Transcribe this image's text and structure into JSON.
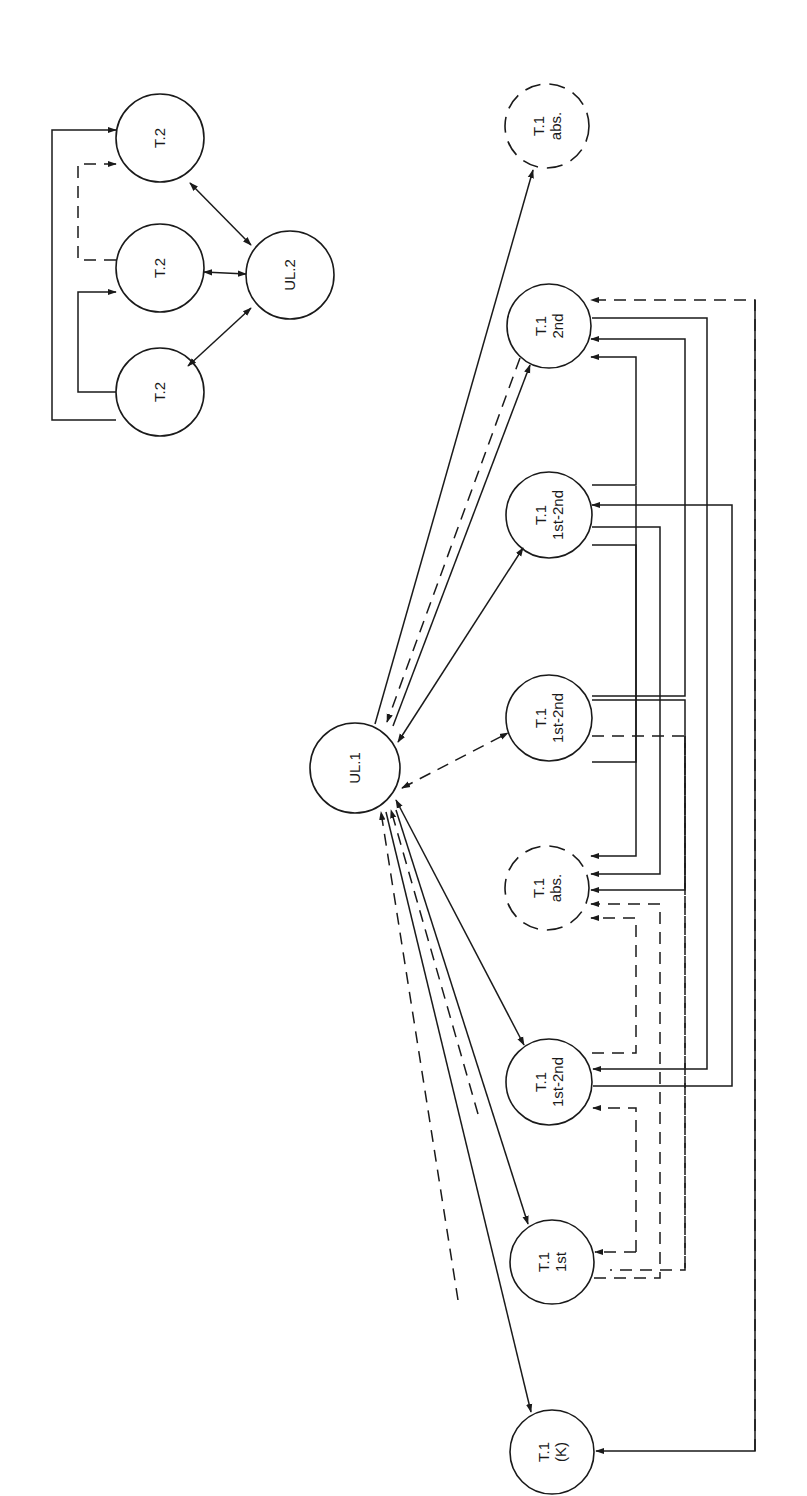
{
  "diagram": {
    "title": "",
    "orientation": "rotated-90-ccw",
    "colors": {
      "ink": "#1a1a1a",
      "paper": "#ffffff"
    },
    "clusters": [
      {
        "id": "group2",
        "label": "UL.2 group"
      },
      {
        "id": "group1",
        "label": "UL.1 group"
      }
    ],
    "nodes": [
      {
        "id": "t2a",
        "cluster": "group2",
        "lines": [
          "T.2"
        ],
        "cx": 160,
        "cy": 138,
        "r": 44,
        "style": "solid"
      },
      {
        "id": "t2b",
        "cluster": "group2",
        "lines": [
          "T.2"
        ],
        "cx": 160,
        "cy": 268,
        "r": 44,
        "style": "solid"
      },
      {
        "id": "t2c",
        "cluster": "group2",
        "lines": [
          "T.2"
        ],
        "cx": 160,
        "cy": 392,
        "r": 44,
        "style": "solid"
      },
      {
        "id": "ul2",
        "cluster": "group2",
        "lines": [
          "UL.2"
        ],
        "cx": 290,
        "cy": 275,
        "r": 44,
        "style": "solid"
      },
      {
        "id": "ul1",
        "cluster": "group1",
        "lines": [
          "UL.1"
        ],
        "cx": 355,
        "cy": 768,
        "r": 45,
        "style": "solid"
      },
      {
        "id": "t1abs_top",
        "cluster": "group1",
        "lines": [
          "T.1",
          "abs."
        ],
        "cx": 547,
        "cy": 126,
        "r": 42,
        "style": "dashed"
      },
      {
        "id": "t1_2nd",
        "cluster": "group1",
        "lines": [
          "T.1",
          "2nd"
        ],
        "cx": 549,
        "cy": 326,
        "r": 42,
        "style": "solid"
      },
      {
        "id": "t1_12a",
        "cluster": "group1",
        "lines": [
          "T.1",
          "1st-2nd"
        ],
        "cx": 549,
        "cy": 515,
        "r": 43,
        "style": "solid"
      },
      {
        "id": "t1_12b",
        "cluster": "group1",
        "lines": [
          "T.1",
          "1st-2nd"
        ],
        "cx": 549,
        "cy": 718,
        "r": 43,
        "style": "solid"
      },
      {
        "id": "t1abs_mid",
        "cluster": "group1",
        "lines": [
          "T.1",
          "abs."
        ],
        "cx": 547,
        "cy": 888,
        "r": 42,
        "style": "dashed"
      },
      {
        "id": "t1_12c",
        "cluster": "group1",
        "lines": [
          "T.1",
          "1st-2nd"
        ],
        "cx": 549,
        "cy": 1082,
        "r": 43,
        "style": "solid"
      },
      {
        "id": "t1_1st",
        "cluster": "group1",
        "lines": [
          "T.1",
          "1st"
        ],
        "cx": 552,
        "cy": 1262,
        "r": 42,
        "style": "solid"
      },
      {
        "id": "t1_k",
        "cluster": "group1",
        "lines": [
          "T.1",
          "(K)"
        ],
        "cx": 552,
        "cy": 1452,
        "r": 42,
        "style": "solid"
      }
    ],
    "edges": [
      {
        "from": "ul2",
        "to": "t2a",
        "style": "solid",
        "arrows": "both"
      },
      {
        "from": "ul2",
        "to": "t2b",
        "style": "solid",
        "arrows": "both"
      },
      {
        "from": "ul2",
        "to": "t2c",
        "style": "solid",
        "arrows": "both"
      },
      {
        "from": "t2c",
        "to": "t2a",
        "style": "solid",
        "arrows": "end",
        "route": "left-bracket-outer"
      },
      {
        "from": "t2c",
        "to": "t2b",
        "style": "solid",
        "arrows": "end",
        "route": "left-bracket-inner"
      },
      {
        "from": "t2b",
        "to": "t2a",
        "style": "dashed",
        "arrows": "end",
        "route": "left-bracket-inner"
      },
      {
        "from": "ul1",
        "to": "t1abs_top",
        "style": "solid",
        "arrows": "end"
      },
      {
        "from": "t1_2nd",
        "to": "ul1",
        "style": "dashed",
        "arrows": "end"
      },
      {
        "from": "ul1",
        "to": "t1_2nd",
        "style": "solid",
        "arrows": "end"
      },
      {
        "from": "ul1",
        "to": "t1_12a",
        "style": "solid",
        "arrows": "both"
      },
      {
        "from": "ul1",
        "to": "t1_12b",
        "style": "dashed",
        "arrows": "both"
      },
      {
        "from": "ul1",
        "to": "t1_12c",
        "style": "solid",
        "arrows": "both"
      },
      {
        "from": "t1_1st",
        "to": "ul1",
        "style": "dashed",
        "arrows": "end"
      },
      {
        "from": "ul1",
        "to": "t1_1st",
        "style": "solid",
        "arrows": "end"
      },
      {
        "from": "t1_k",
        "to": "ul1",
        "style": "dashed",
        "arrows": "end"
      },
      {
        "from": "ul1",
        "to": "t1_k",
        "style": "solid",
        "arrows": "end"
      },
      {
        "from": "t1_k",
        "to": "t1_2nd",
        "style": "dashed",
        "arrows": "end",
        "route": "right-bus"
      },
      {
        "from": "t1_2nd",
        "to": "t1_12c",
        "style": "solid",
        "arrows": "end",
        "route": "right-bus"
      },
      {
        "from": "t1_12a",
        "to": "t1_2nd",
        "style": "solid",
        "arrows": "end",
        "route": "right-bus"
      },
      {
        "from": "t1_12a",
        "to": "t1abs_mid",
        "style": "solid",
        "arrows": "end",
        "route": "right-bus"
      },
      {
        "from": "t1_12c",
        "to": "t1_12a",
        "style": "solid",
        "arrows": "end",
        "route": "right-bus"
      },
      {
        "from": "t1_12b",
        "to": "t1abs_mid",
        "style": "solid",
        "arrows": "end",
        "route": "right-bus"
      },
      {
        "from": "t1_12b",
        "to": "t1_2nd",
        "style": "solid",
        "arrows": "end",
        "route": "right-bus"
      },
      {
        "from": "t1_12b",
        "to": "t1_12c",
        "style": "dashed",
        "arrows": "end",
        "route": "right-bus"
      },
      {
        "from": "t1_12c",
        "to": "t1abs_mid",
        "style": "dashed",
        "arrows": "end",
        "route": "right-bus"
      },
      {
        "from": "t1_1st",
        "to": "t1abs_mid",
        "style": "dashed",
        "arrows": "end",
        "route": "right-bus"
      },
      {
        "from": "t1_1st",
        "to": "t1_12c",
        "style": "dashed",
        "arrows": "end",
        "route": "right-bus"
      },
      {
        "from": "t1_k",
        "to": "t1_k",
        "style": "solid",
        "arrows": "end",
        "route": "right-bus"
      }
    ]
  }
}
